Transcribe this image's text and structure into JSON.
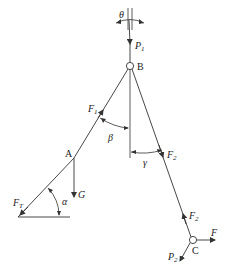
{
  "diagram": {
    "type": "force diagram",
    "points": {
      "A": {
        "label": "A"
      },
      "B": {
        "label": "B"
      },
      "C": {
        "label": "C"
      }
    },
    "forces": {
      "P1": {
        "base": "P",
        "sub": "1"
      },
      "P2": {
        "base": "P",
        "sub": "2"
      },
      "F1": {
        "base": "F",
        "sub": "1"
      },
      "F2_upper": {
        "base": "F",
        "sub": "2"
      },
      "F2_lower": {
        "base": "F",
        "sub": "2"
      },
      "FT": {
        "base": "F",
        "sub": "T"
      },
      "G": {
        "base": "G"
      },
      "F": {
        "base": "F"
      }
    },
    "angles": {
      "theta": "θ",
      "beta": "β",
      "gamma": "γ",
      "alpha": "α"
    },
    "colors": {
      "line": "#333333",
      "text": "#222222"
    }
  }
}
